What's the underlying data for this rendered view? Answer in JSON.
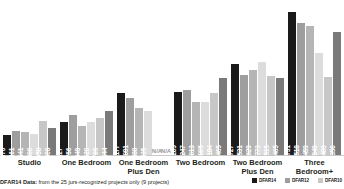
{
  "chart_data": {
    "type": "bar",
    "title": "",
    "xlabel": "",
    "ylabel": "",
    "ylim": [
      0,
      2900
    ],
    "grid": false,
    "legend_position": "bottom-right",
    "categories": [
      "Studio",
      "One Bedroom",
      "One Bedroom\nPlus Den",
      "Two Bedroom",
      "Two Bedroom\nPlus Den",
      "Three Bedroom+"
    ],
    "category_labels": [
      {
        "line1": "Studio",
        "line2": ""
      },
      {
        "line1": "One Bedroom",
        "line2": ""
      },
      {
        "line1": "One Bedroom",
        "line2": "Plus Den"
      },
      {
        "line1": "Two Bedroom",
        "line2": ""
      },
      {
        "line1": "Two Bedroom",
        "line2": "Plus Den"
      },
      {
        "line1": "Three Bedroom+",
        "line2": ""
      }
    ],
    "series": [
      {
        "name": "DFAR14",
        "color": "#1a1a1a",
        "values": [
          376,
          627,
          1177,
          1205,
          1727,
          2731
        ]
      },
      {
        "name": "DFAR12",
        "color": "#8c8c8c",
        "values": [
          461,
          756,
          1091,
          1247,
          1531,
          2518
        ]
      },
      {
        "name": "DFAR10",
        "color": "#a6a6a6",
        "values": [
          441,
          549,
          888,
          1013,
          1629,
          2459
        ]
      },
      {
        "name": "DFAR08",
        "color": "#d4d4d4",
        "values": [
          400,
          629,
          835,
          1005,
          1773,
          1949
        ]
      },
      {
        "name": "DFAR06",
        "color": "#c0c0c0",
        "values": [
          658,
          709,
          null,
          1184,
          1515,
          1489
        ]
      },
      {
        "name": "DFAR04",
        "color": "#767676",
        "values": [
          508,
          844,
          null,
          1465,
          1465,
          2350
        ]
      }
    ],
    "bars": [
      {
        "category": "Studio",
        "items": [
          {
            "value": 376,
            "label": "376",
            "color": "#1a1a1a",
            "text": "#ffffff"
          },
          {
            "value": 461,
            "label": "461",
            "color": "#9e9e9e",
            "text": "#ffffff"
          },
          {
            "value": 441,
            "label": "441",
            "color": "#b5b5b5",
            "text": "#ffffff"
          },
          {
            "value": 400,
            "label": "400",
            "color": "#dcdcdc",
            "text": "#ffffff"
          },
          {
            "value": 658,
            "label": "658",
            "color": "#c7c7c7",
            "text": "#ffffff"
          },
          {
            "value": 508,
            "label": "508",
            "color": "#7a7a7a",
            "text": "#ffffff"
          }
        ]
      },
      {
        "category": "One Bedroom",
        "items": [
          {
            "value": 627,
            "label": "627",
            "color": "#1a1a1a",
            "text": "#ffffff"
          },
          {
            "value": 756,
            "label": "756",
            "color": "#9e9e9e",
            "text": "#ffffff"
          },
          {
            "value": 549,
            "label": "549",
            "color": "#b5b5b5",
            "text": "#ffffff"
          },
          {
            "value": 629,
            "label": "629",
            "color": "#dcdcdc",
            "text": "#ffffff"
          },
          {
            "value": 709,
            "label": "709",
            "color": "#c7c7c7",
            "text": "#ffffff"
          },
          {
            "value": 844,
            "label": "844",
            "color": "#7a7a7a",
            "text": "#ffffff"
          }
        ]
      },
      {
        "category": "One Bedroom Plus Den",
        "items": [
          {
            "value": 1177,
            "label": "1,177",
            "color": "#1a1a1a",
            "text": "#ffffff"
          },
          {
            "value": 1091,
            "label": "1,091",
            "color": "#9e9e9e",
            "text": "#ffffff"
          },
          {
            "value": 888,
            "label": "888",
            "color": "#b5b5b5",
            "text": "#ffffff"
          },
          {
            "value": 835,
            "label": "835",
            "color": "#dcdcdc",
            "text": "#ffffff"
          },
          {
            "value": null,
            "label": "N/A",
            "color": "#ffffff",
            "text": "#9a9a9a"
          },
          {
            "value": null,
            "label": "N/A",
            "color": "#ffffff",
            "text": "#9a9a9a"
          }
        ]
      },
      {
        "category": "Two Bedroom",
        "items": [
          {
            "value": 1205,
            "label": "1,205",
            "color": "#1a1a1a",
            "text": "#ffffff"
          },
          {
            "value": 1247,
            "label": "1,247",
            "color": "#9e9e9e",
            "text": "#ffffff"
          },
          {
            "value": 1013,
            "label": "1,013",
            "color": "#b5b5b5",
            "text": "#ffffff"
          },
          {
            "value": 1005,
            "label": "1,005",
            "color": "#dcdcdc",
            "text": "#ffffff"
          },
          {
            "value": 1184,
            "label": "1,184",
            "color": "#c7c7c7",
            "text": "#ffffff"
          },
          {
            "value": 1465,
            "label": "1,465",
            "color": "#7a7a7a",
            "text": "#ffffff"
          }
        ]
      },
      {
        "category": "Two Bedroom Plus Den",
        "items": [
          {
            "value": 1727,
            "label": "1,727",
            "color": "#1a1a1a",
            "text": "#ffffff"
          },
          {
            "value": 1531,
            "label": "1,531",
            "color": "#9e9e9e",
            "text": "#ffffff"
          },
          {
            "value": 1629,
            "label": "1,629",
            "color": "#b5b5b5",
            "text": "#ffffff"
          },
          {
            "value": 1773,
            "label": "1,773",
            "color": "#dcdcdc",
            "text": "#ffffff"
          },
          {
            "value": 1515,
            "label": "1,515",
            "color": "#c7c7c7",
            "text": "#ffffff"
          },
          {
            "value": 1465,
            "label": "1,465",
            "color": "#7a7a7a",
            "text": "#ffffff"
          }
        ]
      },
      {
        "category": "Three Bedroom+",
        "items": [
          {
            "value": 2731,
            "label": "2,731",
            "color": "#1a1a1a",
            "text": "#ffffff"
          },
          {
            "value": 2518,
            "label": "2,518",
            "color": "#9e9e9e",
            "text": "#ffffff"
          },
          {
            "value": 2459,
            "label": "2,459",
            "color": "#b5b5b5",
            "text": "#ffffff"
          },
          {
            "value": 1949,
            "label": "1,949",
            "color": "#dcdcdc",
            "text": "#ffffff"
          },
          {
            "value": 1489,
            "label": "1,489",
            "color": "#c7c7c7",
            "text": "#ffffff"
          },
          {
            "value": 2350,
            "label": "2,350",
            "color": "#7a7a7a",
            "text": "#ffffff"
          }
        ]
      }
    ]
  },
  "footnote": {
    "strong": "DFAR14 Data:",
    "rest": " from the 25 jurs-recognized projects only (9 projects)"
  },
  "legend": {
    "items": [
      {
        "label": "DFAR14",
        "color": "#1a1a1a"
      },
      {
        "label": "DFAR12",
        "color": "#9e9e9e"
      },
      {
        "label": "DFAR10",
        "color": "#c7c7c7"
      }
    ]
  }
}
